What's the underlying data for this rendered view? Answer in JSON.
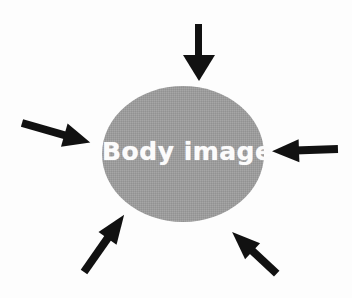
{
  "figure": {
    "type": "concept-diagram",
    "background_color": "#fdfdfd"
  },
  "central_node": {
    "label": "Body image",
    "shape": "ellipse",
    "fill_color": "#9a9a9a",
    "text_color": "#fbfbfb",
    "center_x": 183,
    "center_y": 154,
    "radius_x": 81,
    "radius_y": 68
  },
  "arrows": [
    {
      "name": "top-arrow",
      "direction": "down",
      "color": "#111111",
      "from_x": 199,
      "from_y": 24,
      "to_x": 199,
      "to_y": 80
    },
    {
      "name": "left-arrow",
      "direction": "right",
      "color": "#111111",
      "from_x": 22,
      "from_y": 123,
      "to_x": 91,
      "to_y": 143
    },
    {
      "name": "right-arrow",
      "direction": "left",
      "color": "#111111",
      "from_x": 337,
      "from_y": 150,
      "to_x": 272,
      "to_y": 148
    },
    {
      "name": "bottom-left-arrow",
      "direction": "up-right",
      "color": "#111111",
      "from_x": 84,
      "from_y": 272,
      "to_x": 124,
      "to_y": 215
    },
    {
      "name": "bottom-right-arrow",
      "direction": "up-left",
      "color": "#111111",
      "from_x": 276,
      "from_y": 273,
      "to_x": 229,
      "to_y": 223
    }
  ]
}
